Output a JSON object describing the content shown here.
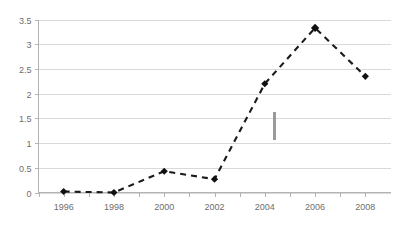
{
  "chart_data": {
    "type": "line",
    "title": "",
    "subtitle": "",
    "xlabel": "",
    "ylabel": "",
    "categories": [
      1996,
      1998,
      2000,
      2002,
      2004,
      2006,
      2008
    ],
    "x": [
      1996,
      1998,
      2000,
      2002,
      2004,
      2006,
      2008
    ],
    "values": [
      0.02,
      0.0,
      0.43,
      0.27,
      2.2,
      3.33,
      2.35
    ],
    "series": [
      {
        "name": "",
        "values": [
          0.02,
          0.0,
          0.43,
          0.27,
          2.2,
          3.33,
          2.35
        ]
      }
    ],
    "xlim": [
      1995,
      2009
    ],
    "ylim": [
      0,
      3.5
    ],
    "ytick_labels": [
      "0",
      "0.5",
      "1",
      "1.5",
      "2",
      "2.5",
      "3",
      "3.5"
    ],
    "ytick_values": [
      0,
      0.5,
      1,
      1.5,
      2,
      2.5,
      3,
      3.5
    ],
    "xtick_labels": [
      "1996",
      "1998",
      "2000",
      "2002",
      "2004",
      "2006",
      "2008"
    ],
    "xtick_values": [
      1996,
      1998,
      2000,
      2002,
      2004,
      2006,
      2008
    ],
    "grid": "horizontal",
    "legend": "none",
    "line_style": "dashed",
    "marker": "diamond",
    "colors": {
      "line": "#1a1a1a",
      "marker": "#111111",
      "gridline": "#d9d9d9",
      "axis": "#b3b3b3",
      "tick_label": "#6e6e6e",
      "background": "#ffffff",
      "stray_mark": "#9a9a9a"
    },
    "annotations": [
      {
        "name": "stray-vertical-mark",
        "x": 2004.35,
        "y_top": 1.63,
        "y_bottom": 1.07,
        "text": ""
      }
    ]
  }
}
